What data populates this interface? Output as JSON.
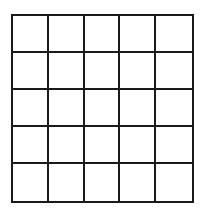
{
  "grid": {
    "rows": 5,
    "columns": 5,
    "line_color": "#1a1a1a",
    "background": "#ffffff",
    "cells": [
      [
        "",
        "",
        "",
        "",
        ""
      ],
      [
        "",
        "",
        "",
        "",
        ""
      ],
      [
        "",
        "",
        "",
        "",
        ""
      ],
      [
        "",
        "",
        "",
        "",
        ""
      ],
      [
        "",
        "",
        "",
        "",
        ""
      ]
    ]
  }
}
